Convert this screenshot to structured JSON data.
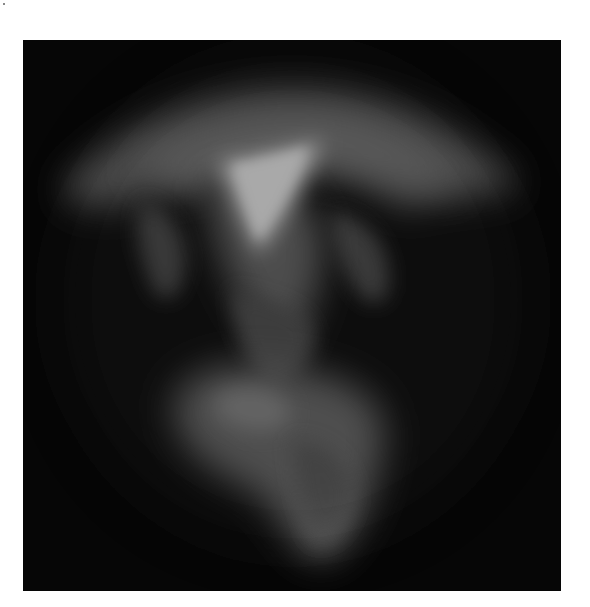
{
  "image": {
    "description": "Abstract glowing translucent form on black background resembling a mushroom/jellyfish shape",
    "background_color": "#060606",
    "border_color": "#ffffff",
    "palette": [
      "#060606",
      "#3a3a3a",
      "#7a7a7a",
      "#b0b0b0",
      "#f4f4f4"
    ]
  }
}
